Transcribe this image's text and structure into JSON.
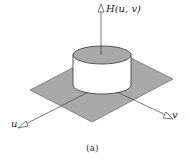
{
  "figure": {
    "caption": "(a)",
    "axes": {
      "vertical_label": "H(u, v)",
      "u_label": "u",
      "v_label": "v"
    },
    "colors": {
      "plane": "#a9a9a9",
      "cylinder_top": "#a9a9a9",
      "cylinder_side": "#ffffff",
      "stroke": "#444444"
    }
  }
}
